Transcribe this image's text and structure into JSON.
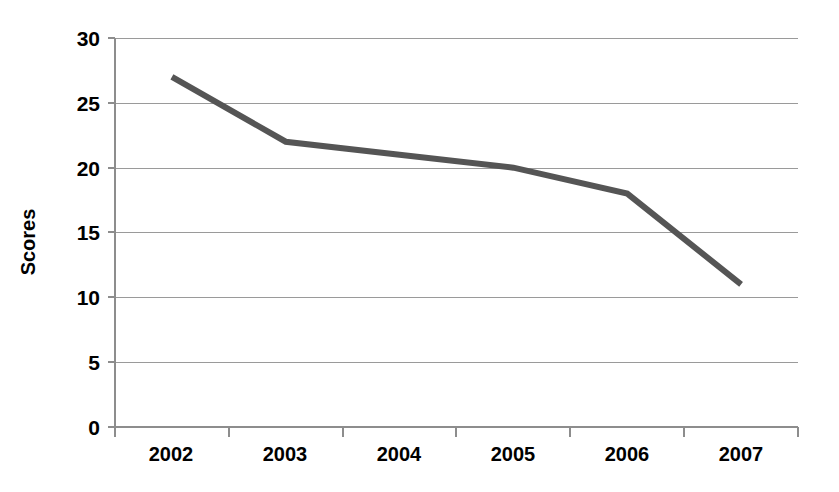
{
  "chart_data": {
    "type": "line",
    "title": "",
    "xlabel": "",
    "ylabel": "Scores",
    "categories": [
      "2002",
      "2003",
      "2004",
      "2005",
      "2006",
      "2007"
    ],
    "values": [
      27,
      22,
      21,
      20,
      18,
      11
    ],
    "series": [
      {
        "name": "Scores",
        "values": [
          27,
          22,
          21,
          20,
          18,
          11
        ]
      }
    ],
    "ylim": [
      0,
      30
    ],
    "ytick_labels": [
      "0",
      "5",
      "10",
      "15",
      "20",
      "25",
      "30"
    ],
    "ytick_values": [
      0,
      5,
      10,
      15,
      20,
      25,
      30
    ],
    "grid": "horizontal",
    "legend": "none",
    "line_color": "#555555",
    "gridline_color": "#9a9a9a",
    "background_color": "#ffffff",
    "text_color": "#000000"
  },
  "axes": {
    "y_title": "Scores",
    "y_labels": {
      "t0": "0",
      "t1": "5",
      "t2": "10",
      "t3": "15",
      "t4": "20",
      "t5": "25",
      "t6": "30"
    },
    "x_labels": {
      "c0": "2002",
      "c1": "2003",
      "c2": "2004",
      "c3": "2005",
      "c4": "2006",
      "c5": "2007"
    }
  }
}
